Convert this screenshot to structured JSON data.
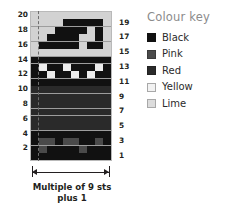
{
  "legend": {
    "title": "Colour key",
    "items": [
      {
        "label": "Black",
        "key": "black",
        "color": "#111111"
      },
      {
        "label": "Pink",
        "key": "pink",
        "color": "#4a4a4a"
      },
      {
        "label": "Red",
        "key": "red",
        "color": "#2a2a2a"
      },
      {
        "label": "Yellow",
        "key": "yellow",
        "color": "#ededed"
      },
      {
        "label": "Lime",
        "key": "lime",
        "color": "#d2d2d2"
      }
    ]
  },
  "caption": {
    "line1": "Multiple of 9 sts",
    "line2": "plus 1"
  },
  "row_numbers_left": [
    "20",
    "18",
    "16",
    "14",
    "12",
    "10",
    "8",
    "6",
    "4",
    "2"
  ],
  "row_numbers_right": [
    "19",
    "17",
    "15",
    "13",
    "11",
    "9",
    "7",
    "5",
    "3",
    "1"
  ],
  "chart_data": {
    "type": "heatmap",
    "xlabel": "Multiple of 9 sts plus 1",
    "ylabel": "",
    "columns": 10,
    "rows": 20,
    "grid_on": true,
    "legend_position": "right",
    "palette": {
      "black": "#111111",
      "pink": "#4a4a4a",
      "red": "#2a2a2a",
      "yellow": "#ededed",
      "lime": "#d2d2d2"
    },
    "repeat_marker_column": 1,
    "row_labels_odd_side": "right",
    "row_labels_even_side": "left",
    "cells": [
      {
        "row": 20,
        "values": [
          "lime",
          "lime",
          "lime",
          "lime",
          "lime",
          "lime",
          "lime",
          "lime",
          "lime",
          "lime"
        ]
      },
      {
        "row": 19,
        "values": [
          "lime",
          "lime",
          "lime",
          "lime",
          "black",
          "black",
          "black",
          "black",
          "black",
          "lime"
        ]
      },
      {
        "row": 18,
        "values": [
          "lime",
          "lime",
          "lime",
          "black",
          "black",
          "black",
          "black",
          "lime",
          "black",
          "lime"
        ]
      },
      {
        "row": 17,
        "values": [
          "lime",
          "lime",
          "black",
          "black",
          "black",
          "black",
          "lime",
          "lime",
          "black",
          "lime"
        ]
      },
      {
        "row": 16,
        "values": [
          "lime",
          "black",
          "black",
          "black",
          "black",
          "black",
          "lime",
          "black",
          "black",
          "lime"
        ]
      },
      {
        "row": 15,
        "values": [
          "lime",
          "lime",
          "lime",
          "lime",
          "lime",
          "lime",
          "lime",
          "lime",
          "lime",
          "lime"
        ]
      },
      {
        "row": 14,
        "values": [
          "black",
          "black",
          "black",
          "black",
          "black",
          "black",
          "black",
          "black",
          "black",
          "black"
        ]
      },
      {
        "row": 13,
        "values": [
          "black",
          "yellow",
          "black",
          "black",
          "yellow",
          "black",
          "black",
          "black",
          "yellow",
          "black"
        ]
      },
      {
        "row": 12,
        "values": [
          "black",
          "black",
          "yellow",
          "black",
          "black",
          "yellow",
          "black",
          "yellow",
          "black",
          "black"
        ]
      },
      {
        "row": 11,
        "values": [
          "black",
          "black",
          "black",
          "black",
          "black",
          "black",
          "black",
          "black",
          "black",
          "black"
        ]
      },
      {
        "row": 10,
        "values": [
          "red",
          "red",
          "red",
          "red",
          "red",
          "red",
          "red",
          "red",
          "red",
          "red"
        ]
      },
      {
        "row": 9,
        "values": [
          "red",
          "red",
          "red",
          "red",
          "red",
          "red",
          "red",
          "red",
          "red",
          "red"
        ]
      },
      {
        "row": 8,
        "values": [
          "red",
          "red",
          "red",
          "red",
          "red",
          "red",
          "red",
          "red",
          "red",
          "red"
        ]
      },
      {
        "row": 7,
        "values": [
          "red",
          "red",
          "red",
          "red",
          "red",
          "red",
          "red",
          "red",
          "red",
          "red"
        ]
      },
      {
        "row": 6,
        "values": [
          "red",
          "red",
          "red",
          "red",
          "red",
          "red",
          "red",
          "red",
          "red",
          "red"
        ]
      },
      {
        "row": 5,
        "values": [
          "red",
          "red",
          "red",
          "red",
          "red",
          "red",
          "red",
          "red",
          "red",
          "red"
        ]
      },
      {
        "row": 4,
        "values": [
          "black",
          "black",
          "black",
          "black",
          "black",
          "black",
          "black",
          "black",
          "black",
          "black"
        ]
      },
      {
        "row": 3,
        "values": [
          "black",
          "pink",
          "pink",
          "black",
          "pink",
          "pink",
          "black",
          "black",
          "pink",
          "black"
        ]
      },
      {
        "row": 2,
        "values": [
          "black",
          "pink",
          "black",
          "black",
          "black",
          "black",
          "pink",
          "black",
          "black",
          "black"
        ]
      },
      {
        "row": 1,
        "values": [
          "black",
          "black",
          "black",
          "black",
          "black",
          "black",
          "black",
          "black",
          "black",
          "black"
        ]
      }
    ]
  }
}
